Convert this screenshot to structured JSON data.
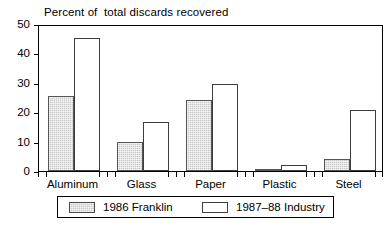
{
  "chart_data": {
    "type": "bar",
    "title": "Percent of  total discards recovered",
    "xlabel": "",
    "ylabel": "",
    "ylim": [
      0,
      50
    ],
    "yticks": [
      0,
      10,
      20,
      30,
      40,
      50
    ],
    "grid": false,
    "legend_position": "bottom",
    "categories": [
      "Aluminum",
      "Glass",
      "Paper",
      "Plastic",
      "Steel"
    ],
    "series": [
      {
        "name": "1986 Franklin",
        "color": "#c9c9c9",
        "values": [
          25.5,
          10,
          24,
          0.7,
          4
        ]
      },
      {
        "name": "1987–88 Industry",
        "color": "#ffffff",
        "values": [
          45.2,
          16.8,
          29.6,
          2,
          20.8
        ]
      }
    ]
  },
  "legend": {
    "items": [
      {
        "label": "1986 Franklin"
      },
      {
        "label": "1987–88 Industry"
      }
    ]
  }
}
